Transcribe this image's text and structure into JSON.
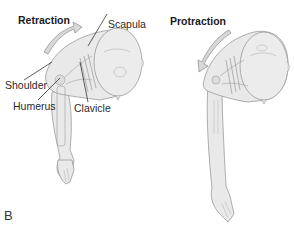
{
  "figure": {
    "panel_label": "B",
    "colors": {
      "skin_fill": "#e9e9e9",
      "outline": "#9a9a9a",
      "arrow_fill": "#d9d9d9",
      "arrow_stroke": "#8a8a8a",
      "leader_line": "#1a1a1a"
    },
    "left": {
      "title": "Retraction",
      "arrow_direction": "backward (toward head/up-right)",
      "labels": {
        "scapula": "Scapula",
        "shoulder": "Shoulder",
        "humerus": "Humerus",
        "clavicle": "Clavicle"
      }
    },
    "right": {
      "title": "Protraction",
      "arrow_direction": "forward (down-left)"
    }
  }
}
